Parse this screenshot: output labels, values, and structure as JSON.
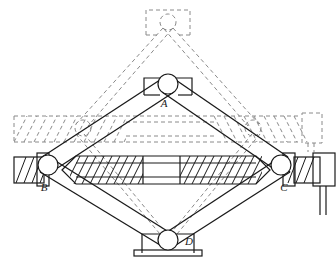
{
  "figure": {
    "width": 336,
    "height": 263,
    "background_color": "#ffffff",
    "solid_line_color": "#1a1a1a",
    "dashed_line_color": "#8a8a8a",
    "hatch_color": "#1a1a1a"
  },
  "labels": {
    "a": "A",
    "b": "B",
    "c": "C",
    "d": "D"
  },
  "joints": [
    {
      "id": "A",
      "label": "A",
      "x": 168,
      "y": 84,
      "r": 10,
      "role": "top-pivot",
      "label_x": 167,
      "label_y": 106
    },
    {
      "id": "B",
      "label": "B",
      "x": 48,
      "y": 165,
      "r": 10,
      "role": "left-nut-pivot",
      "label_x": 44,
      "label_y": 190
    },
    {
      "id": "C",
      "label": "C",
      "x": 281,
      "y": 165,
      "r": 10,
      "role": "right-nut-pivot",
      "label_x": 283,
      "label_y": 190
    },
    {
      "id": "D",
      "label": "D",
      "x": 168,
      "y": 240,
      "r": 10,
      "role": "bottom-pivot",
      "label_x": 185,
      "label_y": 245
    }
  ],
  "phantom_joints": [
    {
      "id": "A-raised",
      "x": 168,
      "y": 22,
      "r": 8,
      "role": "top-pivot-raised-position"
    },
    {
      "id": "B-phantom",
      "x": 83,
      "y": 128,
      "r": 8,
      "role": "left-nut-retracted-position"
    },
    {
      "id": "C-phantom",
      "x": 253,
      "y": 128,
      "r": 8,
      "role": "right-nut-retracted-position"
    }
  ],
  "links": [
    {
      "name": "arm-A-B",
      "from": "A",
      "to": "B",
      "style": "solid-bar"
    },
    {
      "name": "arm-A-C",
      "from": "A",
      "to": "C",
      "style": "solid-bar"
    },
    {
      "name": "arm-B-D",
      "from": "B",
      "to": "D",
      "style": "solid-bar"
    },
    {
      "name": "arm-C-D",
      "from": "C",
      "to": "D",
      "style": "solid-bar"
    }
  ],
  "phantom_links": [
    {
      "name": "phantom-arm-A-B",
      "from": "A-raised",
      "to": "B-phantom",
      "style": "dashed"
    },
    {
      "name": "phantom-arm-A-C",
      "from": "A-raised",
      "to": "C-phantom",
      "style": "dashed"
    },
    {
      "name": "phantom-arm-B-D",
      "from": "B-phantom",
      "to": "D",
      "style": "dashed"
    },
    {
      "name": "phantom-arm-C-D",
      "from": "C-phantom",
      "to": "D",
      "style": "dashed"
    }
  ],
  "components": {
    "lead_screw": {
      "name": "lead-screw",
      "description": "horizontal threaded lead screw spanning B to C",
      "left_thread_start": 70,
      "left_thread_end": 143,
      "smooth_start": 143,
      "smooth_end": 180,
      "right_thread_start": 180,
      "right_thread_end": 262,
      "center_y": 170,
      "half_height": 14
    },
    "phantom_screw": {
      "name": "phantom-lead-screw",
      "description": "dashed lead screw in retracted / raised configuration",
      "x_start": 14,
      "x_end": 322,
      "center_y": 129,
      "half_height": 13
    },
    "top_saddle": {
      "name": "top-saddle-bracket",
      "description": "load saddle bracket at joint A"
    },
    "phantom_top_saddle": {
      "name": "phantom-top-saddle-bracket",
      "description": "dashed load saddle at raised position"
    },
    "base_plate": {
      "name": "base-plate",
      "description": "ground base plate under joint D"
    },
    "drive_block": {
      "name": "drive-motor-block",
      "description": "drive block with two lead wires at right end"
    },
    "phantom_drive_block": {
      "name": "phantom-drive-motor-block",
      "description": "dashed drive block in retracted position"
    },
    "left_nut_block": {
      "name": "left-nut-block",
      "description": "hatched travelling nut block at joint B"
    },
    "right_nut_block": {
      "name": "right-nut-block",
      "description": "hatched travelling nut block at joint C"
    },
    "wires": {
      "name": "power-lead-wires",
      "count": 2
    }
  }
}
